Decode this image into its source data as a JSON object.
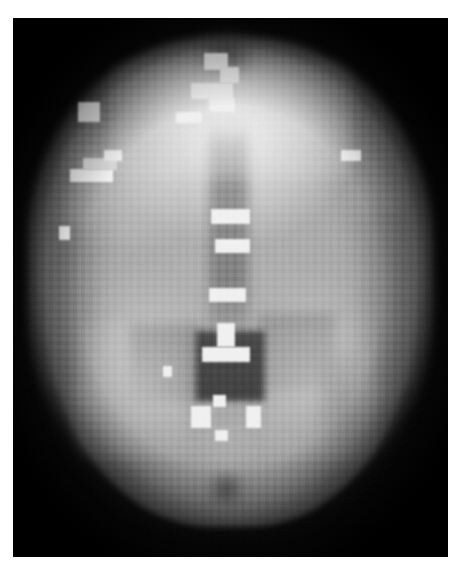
{
  "image": {
    "modality_label": "",
    "view_label": "",
    "caption": ""
  },
  "scan": {
    "type": "axial-brain-slice",
    "background_color": "#050505",
    "page_background": "#ffffff",
    "plate": {
      "x": 13,
      "y": 18,
      "width": 435,
      "height": 539
    },
    "brightest_value": "#f2f2f2",
    "parenchyma_value": "#a6a6a6",
    "ventricle_value": "#4a4a4a",
    "skull_rim_value": "#787878"
  },
  "structures": [
    {
      "name": "skull-halo",
      "label": "skull and scalp halo"
    },
    {
      "name": "frontal-lobes",
      "label": "frontal lobes (bright)"
    },
    {
      "name": "left-hemisphere",
      "label": "left hemisphere"
    },
    {
      "name": "right-hemisphere",
      "label": "right hemisphere"
    },
    {
      "name": "interhemispheric-fissure",
      "label": "interhemispheric fissure (midline)"
    },
    {
      "name": "lateral-ventricles",
      "label": "lateral ventricles (dark)"
    },
    {
      "name": "third-ventricle",
      "label": "third ventricle"
    },
    {
      "name": "occipital-region",
      "label": "occipital region"
    }
  ],
  "markers": [
    {
      "name": "marker-frontal-midline-1",
      "x": 44.0,
      "y": 6.5,
      "w": 5.5,
      "h": 3.2,
      "intensity": "bright"
    },
    {
      "name": "marker-frontal-midline-2",
      "x": 47.5,
      "y": 9.0,
      "w": 4.5,
      "h": 3.0,
      "intensity": "bright"
    },
    {
      "name": "marker-frontal-midline-3",
      "x": 41.0,
      "y": 12.0,
      "w": 9.5,
      "h": 3.0,
      "intensity": "bright"
    },
    {
      "name": "marker-frontal-midline-4",
      "x": 45.0,
      "y": 14.8,
      "w": 6.0,
      "h": 2.6,
      "intensity": "bright"
    },
    {
      "name": "marker-frontal-midline-5",
      "x": 37.5,
      "y": 17.5,
      "w": 6.0,
      "h": 2.0,
      "intensity": "bright"
    },
    {
      "name": "marker-left-frontal",
      "x": 15.0,
      "y": 15.5,
      "w": 5.0,
      "h": 3.8,
      "intensity": "bright"
    },
    {
      "name": "marker-left-lateral-1",
      "x": 13.0,
      "y": 28.0,
      "w": 10.0,
      "h": 2.4,
      "intensity": "bright"
    },
    {
      "name": "marker-left-lateral-2",
      "x": 16.0,
      "y": 26.0,
      "w": 8.0,
      "h": 2.2,
      "intensity": "dim"
    },
    {
      "name": "marker-left-lateral-3",
      "x": 21.0,
      "y": 24.5,
      "w": 4.0,
      "h": 2.0,
      "intensity": "bright"
    },
    {
      "name": "marker-left-temporal",
      "x": 10.5,
      "y": 38.5,
      "w": 2.6,
      "h": 2.6,
      "intensity": "bright"
    },
    {
      "name": "marker-right-parietal",
      "x": 75.5,
      "y": 24.5,
      "w": 4.5,
      "h": 2.0,
      "intensity": "bright"
    },
    {
      "name": "marker-mid-bar-1",
      "x": 45.5,
      "y": 35.5,
      "w": 9.0,
      "h": 2.8,
      "intensity": "bright"
    },
    {
      "name": "marker-mid-bar-2",
      "x": 46.5,
      "y": 41.0,
      "w": 8.0,
      "h": 2.6,
      "intensity": "bright"
    },
    {
      "name": "marker-mid-bar-3",
      "x": 45.0,
      "y": 50.0,
      "w": 8.5,
      "h": 2.6,
      "intensity": "bright"
    },
    {
      "name": "marker-mid-bar-4",
      "x": 47.0,
      "y": 56.5,
      "w": 4.0,
      "h": 4.5,
      "intensity": "bright"
    },
    {
      "name": "marker-mid-bar-5",
      "x": 43.5,
      "y": 61.0,
      "w": 11.0,
      "h": 2.8,
      "intensity": "bright"
    },
    {
      "name": "marker-left-caudate",
      "x": 34.5,
      "y": 64.5,
      "w": 2.0,
      "h": 2.2,
      "intensity": "bright"
    },
    {
      "name": "marker-post-left",
      "x": 41.0,
      "y": 72.0,
      "w": 4.5,
      "h": 4.0,
      "intensity": "bright"
    },
    {
      "name": "marker-post-right",
      "x": 53.5,
      "y": 72.0,
      "w": 3.5,
      "h": 4.0,
      "intensity": "bright"
    },
    {
      "name": "marker-post-center",
      "x": 46.0,
      "y": 70.0,
      "w": 3.0,
      "h": 2.2,
      "intensity": "bright"
    },
    {
      "name": "marker-post-low",
      "x": 46.5,
      "y": 76.5,
      "w": 3.0,
      "h": 2.0,
      "intensity": "bright"
    }
  ],
  "dark_regions": [
    {
      "name": "ventricle-body",
      "x": 42.0,
      "y": 60.0,
      "w": 16.0,
      "h": 12.0
    },
    {
      "name": "ventricle-left",
      "x": 28.0,
      "y": 59.0,
      "w": 14.0,
      "h": 11.0
    },
    {
      "name": "ventricle-right",
      "x": 58.0,
      "y": 58.0,
      "w": 14.0,
      "h": 11.0
    },
    {
      "name": "midline-fissure",
      "x": 46.5,
      "y": 20.0,
      "w": 7.0,
      "h": 40.0
    },
    {
      "name": "posterior-dark",
      "x": 47.0,
      "y": 86.0,
      "w": 5.0,
      "h": 4.5
    },
    {
      "name": "upper-midline-dark",
      "x": 45.0,
      "y": 4.0,
      "w": 8.0,
      "h": 6.0
    }
  ]
}
